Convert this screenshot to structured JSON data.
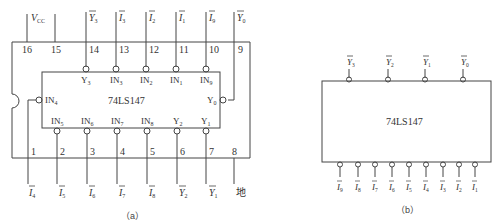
{
  "diagram_a": {
    "caption": "（a）",
    "chip_label": "74LS147",
    "top_pins": [
      {
        "num": "16",
        "signal": "V",
        "sub": "CC",
        "bar": false
      },
      {
        "num": "15",
        "signal": "",
        "sub": "",
        "bar": false
      },
      {
        "num": "14",
        "signal": "Y",
        "sub": "3",
        "bar": true
      },
      {
        "num": "13",
        "signal": "I",
        "sub": "3",
        "bar": true
      },
      {
        "num": "12",
        "signal": "I",
        "sub": "2",
        "bar": true
      },
      {
        "num": "11",
        "signal": "I",
        "sub": "1",
        "bar": true
      },
      {
        "num": "10",
        "signal": "I",
        "sub": "9",
        "bar": true
      },
      {
        "num": "9",
        "signal": "Y",
        "sub": "0",
        "bar": true
      }
    ],
    "bottom_pins": [
      {
        "num": "1",
        "signal": "I",
        "sub": "4",
        "bar": true
      },
      {
        "num": "2",
        "signal": "I",
        "sub": "5",
        "bar": true
      },
      {
        "num": "3",
        "signal": "I",
        "sub": "6",
        "bar": true
      },
      {
        "num": "4",
        "signal": "I",
        "sub": "7",
        "bar": true
      },
      {
        "num": "5",
        "signal": "I",
        "sub": "8",
        "bar": true
      },
      {
        "num": "6",
        "signal": "Y",
        "sub": "2",
        "bar": true
      },
      {
        "num": "7",
        "signal": "Y",
        "sub": "1",
        "bar": true
      },
      {
        "num": "8",
        "signal": "地",
        "sub": "",
        "bar": false
      }
    ],
    "inner_top_labels": [
      {
        "main": "Y",
        "sub": "3"
      },
      {
        "main": "IN",
        "sub": "3"
      },
      {
        "main": "IN",
        "sub": "2"
      },
      {
        "main": "IN",
        "sub": "1"
      },
      {
        "main": "IN",
        "sub": "9"
      }
    ],
    "inner_bottom_labels": [
      {
        "main": "IN",
        "sub": "5"
      },
      {
        "main": "IN",
        "sub": "6"
      },
      {
        "main": "IN",
        "sub": "7"
      },
      {
        "main": "IN",
        "sub": "8"
      },
      {
        "main": "Y",
        "sub": "2"
      },
      {
        "main": "Y",
        "sub": "1"
      }
    ],
    "inner_left_label": {
      "main": "IN",
      "sub": "4"
    },
    "inner_right_label": {
      "main": "Y",
      "sub": "0"
    }
  },
  "diagram_b": {
    "caption": "（b）",
    "chip_label": "74LS147",
    "outputs": [
      {
        "signal": "Y",
        "sub": "3"
      },
      {
        "signal": "Y",
        "sub": "2"
      },
      {
        "signal": "Y",
        "sub": "1"
      },
      {
        "signal": "Y",
        "sub": "0"
      }
    ],
    "inputs": [
      {
        "signal": "I",
        "sub": "9"
      },
      {
        "signal": "I",
        "sub": "8"
      },
      {
        "signal": "I",
        "sub": "7"
      },
      {
        "signal": "I",
        "sub": "6"
      },
      {
        "signal": "I",
        "sub": "5"
      },
      {
        "signal": "I",
        "sub": "4"
      },
      {
        "signal": "I",
        "sub": "3"
      },
      {
        "signal": "I",
        "sub": "2"
      },
      {
        "signal": "I",
        "sub": "1"
      }
    ]
  }
}
